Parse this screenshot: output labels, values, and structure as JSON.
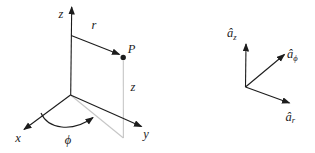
{
  "figure": {
    "left_diagram": {
      "z_axis_label": "z",
      "x_axis_label": "x",
      "y_axis_label": "y",
      "radius_label": "r",
      "point_label": "P",
      "height_label": "z",
      "angle_label": "ϕ"
    },
    "right_diagram": {
      "az_base": "â",
      "az_sub": "z",
      "aphi_base": "â",
      "aphi_sub": "ϕ",
      "ar_base": "â",
      "ar_sub": "r"
    },
    "colors": {
      "line": "#1c1c1c",
      "guide": "#c6c6c6",
      "background": "#ffffff"
    }
  }
}
